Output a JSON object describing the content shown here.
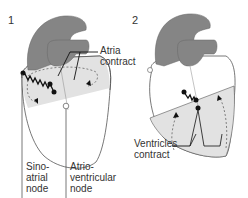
{
  "panels": [
    {
      "number": "1",
      "labels": {
        "atria": [
          "Atria",
          "contract"
        ],
        "sinoatrial": [
          "Sino-",
          "atrial",
          "node"
        ],
        "atrioventricular": [
          "Atrio-",
          "ventricular",
          "node"
        ]
      }
    },
    {
      "number": "2",
      "labels": {
        "ventricles": [
          "Ventricles",
          "contract"
        ]
      }
    }
  ],
  "colors": {
    "vessels": "#858585",
    "shaded_region": "#e2e2e2",
    "outline": "#555555",
    "ink": "#111111"
  }
}
